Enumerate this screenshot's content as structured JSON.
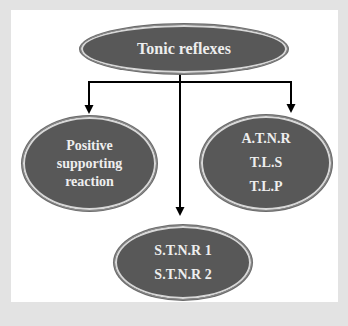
{
  "diagram": {
    "type": "tree",
    "colors": {
      "background": "#e3e3e3",
      "panel": "#ffffff",
      "node_fill": "#585858",
      "node_text": "#eeeeee",
      "connector": "#000000"
    },
    "root": {
      "label": "Tonic reflexes"
    },
    "children": [
      {
        "position": "left",
        "lines": [
          "Positive",
          "supporting",
          "reaction"
        ]
      },
      {
        "position": "bottom-center",
        "lines": [
          "S.T.N.R 1",
          "S.T.N.R 2"
        ]
      },
      {
        "position": "right",
        "lines": [
          "A.T.N.R",
          "T.L.S",
          "T.L.P"
        ]
      }
    ],
    "edges": [
      {
        "from": "Tonic reflexes",
        "to": "Positive supporting reaction"
      },
      {
        "from": "Tonic reflexes",
        "to": "S.T.N.R 1 / S.T.N.R 2"
      },
      {
        "from": "Tonic reflexes",
        "to": "A.T.N.R / T.L.S / T.L.P"
      }
    ]
  }
}
